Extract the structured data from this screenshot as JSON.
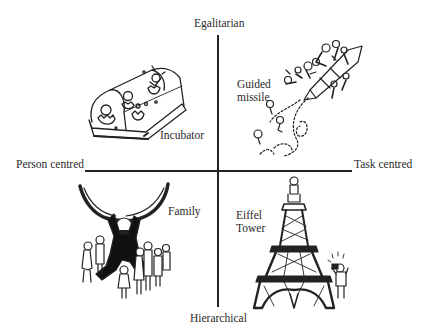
{
  "diagram": {
    "axes": {
      "top": "Egalitarian",
      "bottom": "Hierarchical",
      "left": "Person centred",
      "right": "Task centred"
    },
    "quadrants": [
      {
        "position": "top-left",
        "label": "Incubator",
        "illustration": "incubator-icon"
      },
      {
        "position": "top-right",
        "label_line1": "Guided",
        "label_line2": "missile",
        "illustration": "guided-missile-icon"
      },
      {
        "position": "bottom-left",
        "label": "Family",
        "illustration": "family-icon"
      },
      {
        "position": "bottom-right",
        "label_line1": "Eiffel",
        "label_line2": "Tower",
        "illustration": "eiffel-tower-icon"
      }
    ],
    "colors": {
      "ink": "#222222",
      "background": "#ffffff"
    }
  }
}
